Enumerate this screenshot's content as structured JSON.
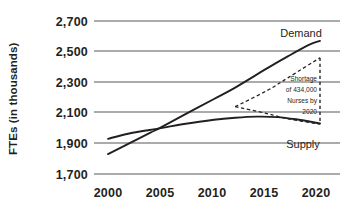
{
  "chart_data": {
    "type": "line",
    "title": "",
    "xlabel": "",
    "ylabel": "FTEs (in thousands)",
    "xlim": [
      2000,
      2021
    ],
    "ylim": [
      1700,
      2700
    ],
    "yticks": [
      2700,
      2500,
      2300,
      2100,
      1900,
      1700
    ],
    "ytick_labels": [
      "2,700",
      "2,500",
      "2,300",
      "2,100",
      "1,900",
      "1,700"
    ],
    "xticks": [
      2000,
      2005,
      2010,
      2015,
      2020
    ],
    "xtick_labels": [
      "2000",
      "2005",
      "2010",
      "2015",
      "2020"
    ],
    "grid": "horizontal",
    "legend_position": "inline-labels",
    "series": [
      {
        "name": "Demand",
        "style": "solid",
        "x": [
          2000,
          2002,
          2004,
          2005,
          2007,
          2010,
          2012,
          2015,
          2017,
          2019,
          2020
        ],
        "values": [
          1830,
          1900,
          1970,
          2005,
          2080,
          2190,
          2265,
          2390,
          2470,
          2545,
          2570
        ]
      },
      {
        "name": "Supply",
        "style": "solid",
        "x": [
          2000,
          2002,
          2005,
          2007,
          2010,
          2012,
          2014,
          2016,
          2018,
          2019,
          2020
        ],
        "values": [
          1930,
          1965,
          2000,
          2025,
          2055,
          2068,
          2075,
          2072,
          2055,
          2043,
          2030
        ]
      },
      {
        "name": "Shortage upper (demand projection)",
        "style": "dashed",
        "x": [
          2012,
          2015,
          2017,
          2020
        ],
        "values": [
          2140,
          2245,
          2330,
          2460
        ]
      },
      {
        "name": "Shortage lower (supply projection)",
        "style": "dashed",
        "x": [
          2012,
          2015,
          2017,
          2020
        ],
        "values": [
          2140,
          2095,
          2060,
          2026
        ]
      },
      {
        "name": "Shortage gap marker",
        "style": "dashed-vertical",
        "x": [
          2020,
          2020
        ],
        "values": [
          2460,
          2026
        ]
      }
    ],
    "annotations": [
      {
        "name": "shortage-note",
        "lines": [
          "Shortage",
          "of 434,000",
          "Nurses by",
          "2020"
        ],
        "text": "Shortage of 434,000 Nurses by 2020",
        "value": 434000,
        "year": 2020
      },
      {
        "name": "demand-label",
        "text": "Demand",
        "x": 2019,
        "y": 2600
      },
      {
        "name": "supply-label",
        "text": "Supply",
        "x": 2019,
        "y": 1930
      }
    ],
    "colors": {
      "line": "#231f20",
      "grid": "#58595b",
      "background": "#ffffff",
      "text": "#231f20"
    }
  }
}
